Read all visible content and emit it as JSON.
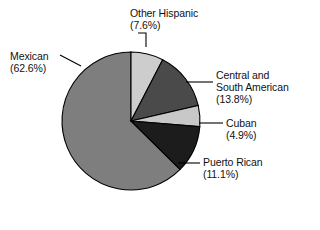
{
  "chart_data": {
    "type": "pie",
    "title": "",
    "subtitle": "",
    "xlabel": "",
    "ylabel": "",
    "legend_position": "callout-labels",
    "grid": false,
    "start_angle_deg": 0,
    "direction": "clockwise",
    "units": "percent",
    "categories": [
      "Other Hispanic",
      "Central and South American",
      "Cuban",
      "Puerto Rican",
      "Mexican"
    ],
    "values": [
      7.6,
      13.8,
      4.9,
      11.1,
      62.6
    ],
    "slices": [
      {
        "name": "Other Hispanic",
        "label": "Other Hispanic",
        "value": 7.6,
        "value_text": "(7.6%)",
        "color": "#cdcdcd"
      },
      {
        "name": "Central and South American",
        "label_line1": "Central and",
        "label_line2": "South American",
        "value": 13.8,
        "value_text": "(13.8%)",
        "color": "#4a4a4a"
      },
      {
        "name": "Cuban",
        "label": "Cuban",
        "value": 4.9,
        "value_text": "(4.9%)",
        "color": "#c8c8c8"
      },
      {
        "name": "Puerto Rican",
        "label": "Puerto Rican",
        "value": 11.1,
        "value_text": "(11.1%)",
        "color": "#1c1c1c"
      },
      {
        "name": "Mexican",
        "label": "Mexican",
        "value": 62.6,
        "value_text": "(62.6%)",
        "color": "#7e7e7e"
      }
    ],
    "outline_color": "#000000"
  },
  "callouts": {
    "other_hispanic": {
      "label": "Other Hispanic",
      "percent": "(7.6%)"
    },
    "mexican": {
      "label": "Mexican",
      "percent": "(62.6%)"
    },
    "central_south_american": {
      "label_line1": "Central and",
      "label_line2": "South American",
      "percent": "(13.8%)"
    },
    "cuban": {
      "label": "Cuban",
      "percent": "(4.9%)"
    },
    "puerto_rican": {
      "label": "Puerto Rican",
      "percent": "(11.1%)"
    }
  }
}
